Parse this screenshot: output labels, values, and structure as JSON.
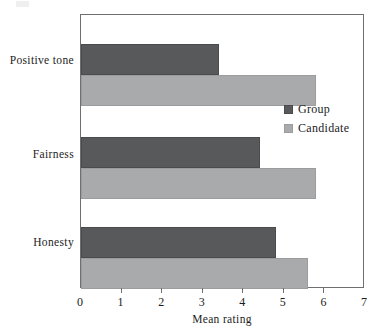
{
  "chart_data": {
    "type": "bar",
    "orientation": "horizontal",
    "title": "",
    "xlabel": "Mean rating",
    "ylabel": "",
    "xlim": [
      0,
      7
    ],
    "xticks": [
      0,
      1,
      2,
      3,
      4,
      5,
      6,
      7
    ],
    "xticklabels": [
      "0",
      "1",
      "2",
      "3",
      "4",
      "5",
      "6",
      "7"
    ],
    "grid": false,
    "legend_position": "center right (inside plot)",
    "categories": [
      "Positive tone",
      "Fairness",
      "Honesty"
    ],
    "series": [
      {
        "name": "Group",
        "color": "#58595B",
        "values": [
          3.4,
          4.4,
          4.8
        ]
      },
      {
        "name": "Candidate",
        "color": "#A9AAAC",
        "values": [
          5.8,
          5.8,
          5.6
        ]
      }
    ]
  },
  "legend": {
    "items": [
      {
        "label": "Group",
        "swatch": "group-color-swatch"
      },
      {
        "label": "Candidate",
        "swatch": "candidate-color-swatch"
      }
    ]
  },
  "axis": {
    "x_title": "Mean rating",
    "tick_labels": [
      "0",
      "1",
      "2",
      "3",
      "4",
      "5",
      "6",
      "7"
    ]
  },
  "categories": [
    "Positive tone",
    "Fairness",
    "Honesty"
  ]
}
